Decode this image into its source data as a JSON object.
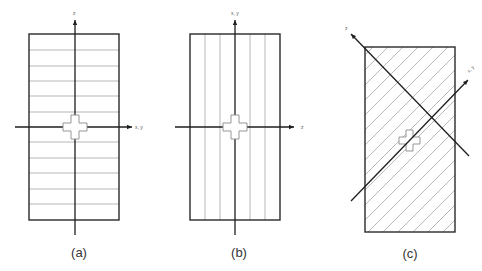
{
  "figure": {
    "panels": [
      {
        "id": "a",
        "caption": "(a)",
        "hatch_direction": "horizontal",
        "axes": {
          "vertical_label": "z",
          "horizontal_label": "x, y"
        }
      },
      {
        "id": "b",
        "caption": "(b)",
        "hatch_direction": "vertical",
        "axes": {
          "vertical_label": "x, y",
          "horizontal_label": "z"
        }
      },
      {
        "id": "c",
        "caption": "(c)",
        "hatch_direction": "diagonal",
        "axes": {
          "diagonal_up_left_label": "z",
          "diagonal_up_right_label": "x, y"
        }
      }
    ],
    "colors": {
      "frame": "#2a2a2a",
      "hatch": "#9a9a9a",
      "axis": "#1e1e1e",
      "cross_outline": "#8a8a8a",
      "background": "#ffffff"
    }
  }
}
